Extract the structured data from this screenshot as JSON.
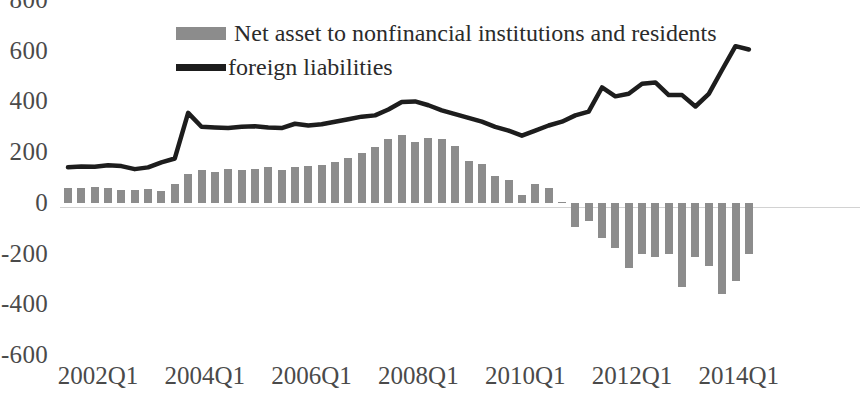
{
  "chart_data": {
    "type": "bar",
    "title": "",
    "subtitle": "",
    "xlabel": "",
    "ylabel": "",
    "ylim": [
      -600,
      800
    ],
    "yticks": [
      800,
      600,
      400,
      200,
      0,
      -200,
      -400,
      -600
    ],
    "xticks": [
      "2002Q1",
      "2004Q1",
      "2006Q1",
      "2008Q1",
      "2010Q1",
      "2012Q1",
      "2014Q1"
    ],
    "xtick_indices": [
      0,
      8,
      16,
      24,
      32,
      40,
      48
    ],
    "grid": false,
    "legend_position": "top-center",
    "colors": {
      "bar": "#8c8c8c",
      "line": "#1d1d1d",
      "axis_text": "#4a4a4a",
      "zero_line": "#d2d2d2",
      "background": "#ffffff"
    },
    "categories": [
      "2002Q1",
      "2002Q2",
      "2002Q3",
      "2002Q4",
      "2003Q1",
      "2003Q2",
      "2003Q3",
      "2003Q4",
      "2004Q1",
      "2004Q2",
      "2004Q3",
      "2004Q4",
      "2005Q1",
      "2005Q2",
      "2005Q3",
      "2005Q4",
      "2006Q1",
      "2006Q2",
      "2006Q3",
      "2006Q4",
      "2007Q1",
      "2007Q2",
      "2007Q3",
      "2007Q4",
      "2008Q1",
      "2008Q2",
      "2008Q3",
      "2008Q4",
      "2009Q1",
      "2009Q2",
      "2009Q3",
      "2009Q4",
      "2010Q1",
      "2010Q2",
      "2010Q3",
      "2010Q4",
      "2011Q1",
      "2011Q2",
      "2011Q3",
      "2011Q4",
      "2012Q1",
      "2012Q2",
      "2012Q3",
      "2012Q4",
      "2013Q1",
      "2013Q2",
      "2013Q3",
      "2013Q4",
      "2014Q1",
      "2014Q2",
      "2014Q3",
      "2014Q4"
    ],
    "series": [
      {
        "name": "Net asset to nonfinancial institutions and residents",
        "type": "bar",
        "values": [
          60,
          58,
          62,
          60,
          50,
          52,
          55,
          48,
          75,
          115,
          130,
          120,
          135,
          128,
          132,
          140,
          128,
          140,
          145,
          150,
          160,
          175,
          195,
          220,
          250,
          268,
          240,
          255,
          250,
          225,
          165,
          155,
          105,
          90,
          30,
          75,
          60,
          5,
          -95,
          -70,
          -140,
          -180,
          -255,
          -200,
          -215,
          -200,
          -330,
          -215,
          -250,
          -360,
          -310,
          -200
        ]
      },
      {
        "name": "foreign liabilities",
        "type": "line",
        "values": [
          140,
          143,
          142,
          148,
          145,
          133,
          140,
          160,
          175,
          355,
          300,
          297,
          295,
          300,
          302,
          297,
          295,
          312,
          305,
          310,
          320,
          330,
          340,
          345,
          368,
          398,
          400,
          385,
          365,
          350,
          335,
          320,
          300,
          285,
          265,
          285,
          305,
          320,
          345,
          360,
          455,
          420,
          430,
          470,
          475,
          425,
          425,
          380,
          430,
          525,
          618,
          605
        ]
      }
    ]
  },
  "legend": {
    "items": [
      {
        "label": "Net asset to nonfinancial institutions and residents",
        "marker": "bar-swatch"
      },
      {
        "label": "foreign liabilities",
        "marker": "line-swatch"
      }
    ]
  }
}
